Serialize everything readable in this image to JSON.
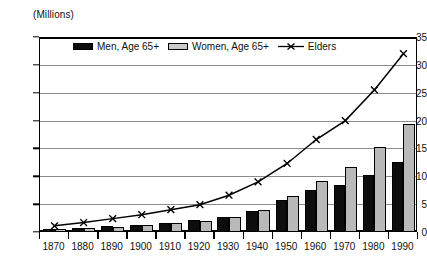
{
  "chart_data": {
    "type": "bar",
    "title": "",
    "subtitle": "",
    "unit_label": "(Millions)",
    "xlabel": "",
    "ylabel": "",
    "categories": [
      "1870",
      "1880",
      "1890",
      "1900",
      "1910",
      "1920",
      "1930",
      "1940",
      "1950",
      "1960",
      "1970",
      "1980",
      "1990"
    ],
    "ylim": [
      0,
      35
    ],
    "yticks": [
      0,
      5,
      10,
      15,
      20,
      25,
      30,
      35
    ],
    "ytick_labels": [
      "0",
      "5",
      "10",
      "15",
      "20",
      "25",
      "30",
      "35"
    ],
    "grid": true,
    "legend_position": "top-center",
    "series": [
      {
        "name": "Men, Age 65+",
        "type": "bar",
        "color": "#0d0d0d",
        "values": [
          0.6,
          0.8,
          1.0,
          1.3,
          1.7,
          2.1,
          2.7,
          3.8,
          5.8,
          7.5,
          8.4,
          10.3,
          12.6
        ]
      },
      {
        "name": "Women, Age 65+",
        "type": "bar",
        "color": "#b9b9b9",
        "values": [
          0.5,
          0.7,
          0.9,
          1.2,
          1.6,
          2.0,
          2.7,
          4.0,
          6.5,
          9.1,
          11.6,
          15.2,
          19.3
        ]
      },
      {
        "name": "Elders",
        "type": "line",
        "marker": "x",
        "color": "#000000",
        "values": [
          1.1,
          1.7,
          2.4,
          3.1,
          4.0,
          4.9,
          6.6,
          9.0,
          12.3,
          16.6,
          20.0,
          25.5,
          32.0
        ]
      }
    ]
  },
  "legend": {
    "items": [
      {
        "label": "Men, Age 65+",
        "swatch": "filled-black-rect"
      },
      {
        "label": "Women, Age 65+",
        "swatch": "filled-gray-rect"
      },
      {
        "label": "Elders",
        "swatch": "x-marker-line"
      }
    ]
  },
  "colors": {
    "men_bar": "#0d0d0d",
    "women_bar": "#b9b9b9",
    "elders_line": "#000000",
    "gridline": "#8c8c8c",
    "axis": "#000000",
    "background": "#ffffff"
  }
}
